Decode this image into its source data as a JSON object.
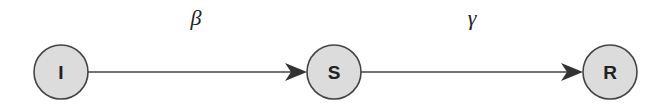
{
  "diagram": {
    "type": "compartmental-model-flow",
    "nodes": [
      {
        "id": "I",
        "label": "I",
        "cx": 61,
        "cy": 72,
        "r": 27
      },
      {
        "id": "S",
        "label": "S",
        "cx": 334,
        "cy": 72,
        "r": 27
      },
      {
        "id": "R",
        "label": "R",
        "cx": 610,
        "cy": 72,
        "r": 27
      }
    ],
    "edges": [
      {
        "from": "I",
        "to": "S",
        "label": "β"
      },
      {
        "from": "S",
        "to": "R",
        "label": "γ"
      }
    ],
    "colors": {
      "node_fill": "#dcdcdc",
      "node_stroke": "#444444",
      "edge": "#444444",
      "text": "#222222"
    }
  }
}
